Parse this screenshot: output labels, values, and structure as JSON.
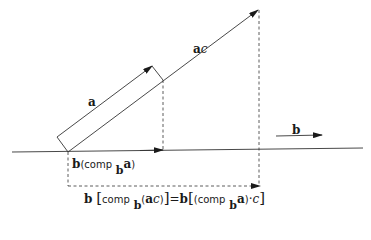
{
  "figure": {
    "labels": {
      "vector_a": "a",
      "vector_ac": "a",
      "vector_ac_scalar": "c",
      "vector_b": "b",
      "projection_a": {
        "b": "b",
        "open": "(comp",
        "sub": "b",
        "a": "a",
        "close": ")"
      },
      "projection_ac": {
        "b1": "b",
        "lbr1": "[",
        "comp1": "comp",
        "sub1": "b",
        "inner1_open": "(",
        "inner1_a": "a",
        "inner1_c": "c",
        "inner1_close": ")",
        "rbr1": "]",
        "eq": "=",
        "b2": "b",
        "lbr2": "[",
        "comp2_open": "(comp",
        "sub2": "b",
        "a2": "a",
        "close2": ")",
        "dot": "·",
        "c2": "c",
        "rbr2": "]"
      }
    },
    "colors": {
      "ink": "#1a1a1a",
      "background": "#ffffff"
    }
  }
}
